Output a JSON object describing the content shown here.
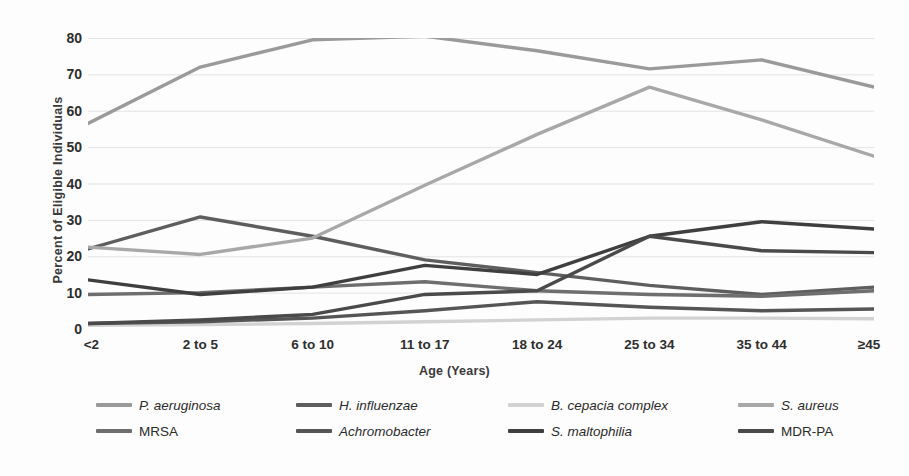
{
  "chart_data": {
    "type": "line",
    "title": "",
    "xlabel": "Age (Years)",
    "ylabel": "Percent of Eligible Individuals",
    "categories": [
      "<2",
      "2 to 5",
      "6 to 10",
      "11 to 17",
      "18 to 24",
      "25 to 34",
      "35 to 44",
      "≥45"
    ],
    "ylim": [
      0,
      80
    ],
    "yticks": [
      0,
      10,
      20,
      30,
      40,
      50,
      60,
      70,
      80
    ],
    "grid": "horizontal",
    "legend_position": "bottom",
    "series": [
      {
        "name": "P. aeruginosa",
        "color": "#9a9a9a",
        "values": [
          56.5,
          72.0,
          79.5,
          80.5,
          76.5,
          71.5,
          74.0,
          66.5
        ]
      },
      {
        "name": "H. influenzae",
        "color": "#5e5e5e",
        "values": [
          22.0,
          30.8,
          25.5,
          19.0,
          15.5,
          12.0,
          9.5,
          11.5
        ]
      },
      {
        "name": "B. cepacia complex",
        "color": "#d2d2d2",
        "values": [
          1.0,
          1.2,
          1.5,
          2.0,
          2.5,
          3.0,
          3.0,
          2.8
        ]
      },
      {
        "name": "S. aureus",
        "color": "#a8a8a8",
        "values": [
          22.5,
          20.5,
          25.0,
          39.5,
          53.5,
          66.5,
          57.5,
          47.5
        ]
      },
      {
        "name": "MRSA",
        "color": "#6e6e6e",
        "values": [
          9.5,
          10.0,
          11.5,
          13.0,
          10.5,
          9.5,
          9.0,
          10.5
        ]
      },
      {
        "name": "Achromobacter",
        "color": "#555555",
        "values": [
          1.5,
          2.0,
          3.0,
          5.0,
          7.5,
          6.0,
          5.0,
          5.5
        ]
      },
      {
        "name": "S. maltophilia",
        "color": "#3f3f3f",
        "values": [
          13.5,
          9.5,
          11.5,
          17.5,
          15.0,
          25.5,
          29.5,
          27.5
        ]
      },
      {
        "name": "MDR-PA",
        "color": "#4a4a4a",
        "values": [
          1.5,
          2.5,
          4.0,
          9.5,
          10.5,
          25.5,
          21.5,
          21.0
        ]
      }
    ]
  },
  "axes": {
    "y_title": "Percent of Eligible Individuals",
    "x_title": "Age (Years)",
    "y_tick_labels": [
      "80",
      "70",
      "60",
      "50",
      "40",
      "30",
      "20",
      "10",
      "0"
    ],
    "x_tick_labels": [
      "<2",
      "2 to 5",
      "6 to 10",
      "11 to 17",
      "18 to 24",
      "25 to 34",
      "35 to 44",
      "≥45"
    ]
  },
  "legend": {
    "items": [
      {
        "label": "P. aeruginosa",
        "color": "#9a9a9a",
        "italic": true
      },
      {
        "label": "H. influenzae",
        "color": "#5e5e5e",
        "italic": true
      },
      {
        "label": "B. cepacia complex",
        "color": "#d2d2d2",
        "italic": true
      },
      {
        "label": "S. aureus",
        "color": "#a8a8a8",
        "italic": true
      },
      {
        "label": "MRSA",
        "color": "#6e6e6e",
        "italic": false
      },
      {
        "label": "Achromobacter",
        "color": "#555555",
        "italic": true
      },
      {
        "label": "S. maltophilia",
        "color": "#3f3f3f",
        "italic": true
      },
      {
        "label": "MDR-PA",
        "color": "#4a4a4a",
        "italic": false
      }
    ],
    "order": [
      0,
      1,
      2,
      3,
      4,
      5,
      6,
      7
    ]
  },
  "style": {
    "gridline_color": "#e3e3e3",
    "background": "#fdfdfd",
    "tick_text_color": "#2e2e2e"
  }
}
